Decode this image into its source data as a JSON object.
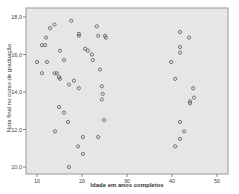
{
  "chart_data": {
    "type": "scatter",
    "title": "",
    "xlabel": "Idade em anos completos",
    "ylabel": "Nota final no curso de graduação",
    "xlim": [
      7.5,
      52.5
    ],
    "ylim": [
      9.6,
      18.5
    ],
    "x_ticks": [
      10,
      20,
      30,
      40,
      50
    ],
    "x_tick_labels": [
      "10",
      "20",
      "30",
      "40",
      "50"
    ],
    "y_ticks": [
      10.0,
      12.0,
      14.0,
      16.0,
      18.0
    ],
    "y_tick_labels": [
      "10,0",
      "12,0",
      "14,0",
      "16,0",
      "18,0"
    ],
    "grid": false,
    "legend": null,
    "marker": "open-circle",
    "colors": {
      "plot_bg": "#e6e6e6",
      "frame": "#999999",
      "marker": "#555555"
    },
    "series": [
      {
        "name": "observations",
        "points": [
          [
            10.0,
            15.6
          ],
          [
            11.1,
            16.5
          ],
          [
            11.8,
            16.5
          ],
          [
            12.0,
            16.9
          ],
          [
            12.9,
            17.4
          ],
          [
            13.9,
            17.6
          ],
          [
            11.1,
            15.0
          ],
          [
            12.2,
            15.6
          ],
          [
            13.9,
            15.0
          ],
          [
            14.4,
            15.0
          ],
          [
            14.9,
            14.8
          ],
          [
            15.1,
            16.2
          ],
          [
            15.1,
            14.7
          ],
          [
            16.0,
            15.7
          ],
          [
            17.1,
            14.4
          ],
          [
            18.2,
            14.6
          ],
          [
            19.3,
            14.2
          ],
          [
            17.6,
            17.8
          ],
          [
            19.3,
            17.1
          ],
          [
            19.3,
            17.0
          ],
          [
            20.7,
            16.3
          ],
          [
            21.3,
            16.2
          ],
          [
            22.2,
            16.0
          ],
          [
            23.3,
            17.5
          ],
          [
            23.6,
            17.0
          ],
          [
            22.4,
            15.7
          ],
          [
            24.0,
            15.2
          ],
          [
            24.4,
            14.3
          ],
          [
            25.1,
            17.0
          ],
          [
            25.3,
            16.9
          ],
          [
            14.9,
            13.2
          ],
          [
            16.0,
            12.9
          ],
          [
            16.9,
            12.4
          ],
          [
            14.0,
            11.9
          ],
          [
            20.2,
            11.6
          ],
          [
            23.6,
            11.6
          ],
          [
            19.1,
            11.1
          ],
          [
            20.2,
            10.7
          ],
          [
            17.1,
            10.0
          ],
          [
            24.6,
            13.9
          ],
          [
            24.4,
            13.6
          ],
          [
            24.9,
            12.5
          ],
          [
            41.8,
            17.2
          ],
          [
            43.8,
            16.9
          ],
          [
            41.8,
            16.4
          ],
          [
            41.8,
            16.1
          ],
          [
            39.8,
            15.6
          ],
          [
            40.7,
            14.7
          ],
          [
            44.7,
            14.2
          ],
          [
            44.9,
            13.7
          ],
          [
            44.0,
            13.5
          ],
          [
            44.0,
            13.4
          ],
          [
            41.8,
            12.4
          ],
          [
            42.7,
            11.9
          ],
          [
            41.8,
            11.5
          ],
          [
            40.7,
            11.1
          ]
        ]
      }
    ]
  }
}
